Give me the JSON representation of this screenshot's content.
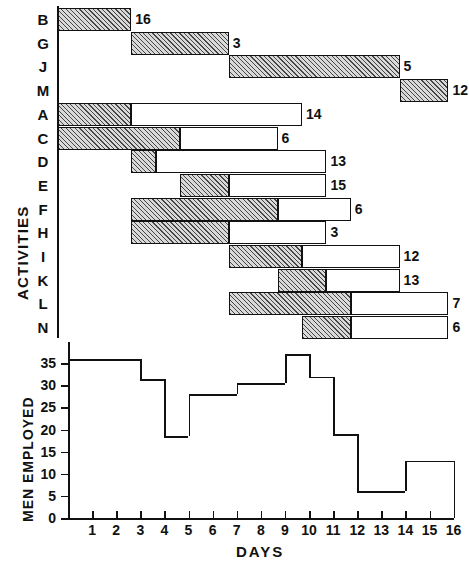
{
  "figure": {
    "gantt_y_title": "ACTIVITIES",
    "hist_y_title": "MEN EMPLOYED",
    "x_title": "DAYS"
  },
  "chart_data": [
    {
      "type": "bar",
      "subtype": "gantt",
      "title": "Activities schedule",
      "xlabel": "DAYS",
      "ylabel": "ACTIVITIES",
      "xlim": [
        0,
        16
      ],
      "grid": false,
      "categories": [
        "B",
        "G",
        "J",
        "M",
        "A",
        "C",
        "D",
        "E",
        "F",
        "H",
        "I",
        "K",
        "L",
        "N"
      ],
      "tasks": [
        {
          "activity": "B",
          "start": 0,
          "duration_hatched": 3,
          "duration_float": 0,
          "end": 3,
          "men": 16
        },
        {
          "activity": "G",
          "start": 3,
          "duration_hatched": 4,
          "duration_float": 0,
          "end": 7,
          "men": 3
        },
        {
          "activity": "J",
          "start": 7,
          "duration_hatched": 7,
          "duration_float": 0,
          "end": 14,
          "men": 5
        },
        {
          "activity": "M",
          "start": 14,
          "duration_hatched": 2,
          "duration_float": 0,
          "end": 16,
          "men": 12
        },
        {
          "activity": "A",
          "start": 0,
          "duration_hatched": 3,
          "duration_float": 7,
          "end": 10,
          "men": 14
        },
        {
          "activity": "C",
          "start": 0,
          "duration_hatched": 5,
          "duration_float": 4,
          "end": 9,
          "men": 6
        },
        {
          "activity": "D",
          "start": 3,
          "duration_hatched": 1,
          "duration_float": 7,
          "end": 11,
          "men": 13
        },
        {
          "activity": "E",
          "start": 5,
          "duration_hatched": 2,
          "duration_float": 4,
          "end": 11,
          "men": 15
        },
        {
          "activity": "F",
          "start": 3,
          "duration_hatched": 6,
          "duration_float": 3,
          "end": 12,
          "men": 6
        },
        {
          "activity": "H",
          "start": 3,
          "duration_hatched": 4,
          "duration_float": 4,
          "end": 11,
          "men": 3
        },
        {
          "activity": "I",
          "start": 7,
          "duration_hatched": 3,
          "duration_float": 4,
          "end": 14,
          "men": 12
        },
        {
          "activity": "K",
          "start": 9,
          "duration_hatched": 2,
          "duration_float": 3,
          "end": 14,
          "men": 13
        },
        {
          "activity": "L",
          "start": 7,
          "duration_hatched": 5,
          "duration_float": 4,
          "end": 16,
          "men": 7
        },
        {
          "activity": "N",
          "start": 10,
          "duration_hatched": 2,
          "duration_float": 4,
          "end": 16,
          "men": 6
        }
      ],
      "bar_value_labels": [
        "16",
        "3",
        "5",
        "12",
        "14",
        "6",
        "13",
        "15",
        "6",
        "3",
        "12",
        "13",
        "7",
        "6"
      ]
    },
    {
      "type": "area",
      "subtype": "step-histogram",
      "title": "Men employed per day",
      "xlabel": "DAYS",
      "ylabel": "MEN EMPLOYED",
      "xlim": [
        0,
        16
      ],
      "ylim": [
        0,
        38
      ],
      "grid": false,
      "x_ticks": [
        "1",
        "2",
        "3",
        "4",
        "5",
        "6",
        "7",
        "8",
        "9",
        "10",
        "11",
        "12",
        "13",
        "14",
        "15",
        "16"
      ],
      "y_ticks": [
        "0",
        "5",
        "10",
        "15",
        "20",
        "25",
        "30",
        "35"
      ],
      "steps": [
        {
          "from_day": 0,
          "to_day": 3,
          "value": 36
        },
        {
          "from_day": 3,
          "to_day": 4,
          "value": 31.5
        },
        {
          "from_day": 4,
          "to_day": 5,
          "value": 18.5
        },
        {
          "from_day": 5,
          "to_day": 7,
          "value": 28
        },
        {
          "from_day": 7,
          "to_day": 9,
          "value": 30.5
        },
        {
          "from_day": 9,
          "to_day": 10,
          "value": 37
        },
        {
          "from_day": 10,
          "to_day": 11,
          "value": 32
        },
        {
          "from_day": 11,
          "to_day": 12,
          "value": 19
        },
        {
          "from_day": 12,
          "to_day": 14,
          "value": 6
        },
        {
          "from_day": 14,
          "to_day": 16,
          "value": 13
        }
      ]
    }
  ]
}
